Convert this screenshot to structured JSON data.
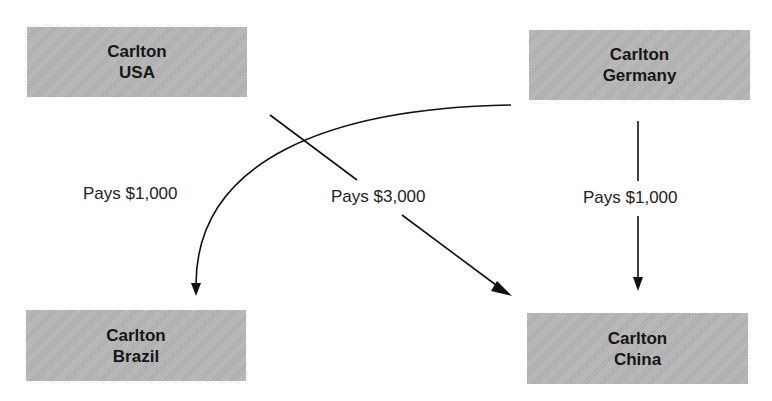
{
  "diagram": {
    "nodes": [
      {
        "id": "usa",
        "line1": "Carlton",
        "line2": "USA"
      },
      {
        "id": "germany",
        "line1": "Carlton",
        "line2": "Germany"
      },
      {
        "id": "brazil",
        "line1": "Carlton",
        "line2": "Brazil"
      },
      {
        "id": "china",
        "line1": "Carlton",
        "line2": "China"
      }
    ],
    "edges": [
      {
        "from": "germany",
        "to": "brazil",
        "label": "Pays $1,000"
      },
      {
        "from": "usa",
        "to": "china",
        "label": "Pays $3,000"
      },
      {
        "from": "germany",
        "to": "china",
        "label": "Pays $1,000"
      }
    ],
    "colors": {
      "box_fill": "#b5b5b5",
      "line": "#111111",
      "text": "#161616"
    }
  }
}
